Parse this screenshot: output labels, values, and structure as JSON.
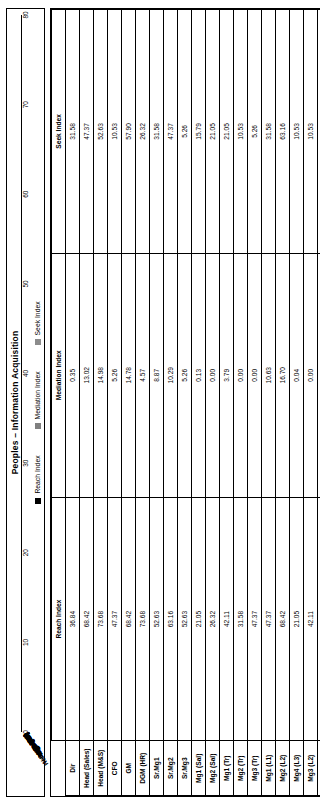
{
  "chart_data": {
    "type": "bar",
    "orientation": "horizontal",
    "title": "Peoples – Information Acquisition",
    "xlabel": "",
    "ylabel": "",
    "xlim": [
      0,
      80
    ],
    "xticks": [
      0,
      10,
      20,
      30,
      40,
      50,
      60,
      70,
      80
    ],
    "grid": true,
    "legend_position": "bottom",
    "categories": [
      "Dir",
      "Head (Sales)",
      "Head (M&S)",
      "CFO",
      "GM",
      "DGM (HR)",
      "Sr.Mg1",
      "Sr.Mg2",
      "Sr.Mg3",
      "Mg1 (Sal)",
      "Mg2 (Sal)",
      "Mg1 (Tr)",
      "Mg2 (Tr)",
      "Mg3 (Tr)",
      "Mg1 (L1)",
      "Mg2 (L2)",
      "Mg4 (L3)",
      "Mg3 (L2)",
      "Mg5 (L4)",
      "Mg6 (L5)"
    ],
    "series": [
      {
        "name": "Reach Index",
        "color": "#000000",
        "values": [
          36.84,
          68.42,
          73.68,
          47.37,
          68.42,
          73.68,
          52.63,
          63.16,
          52.63,
          21.05,
          26.32,
          42.11,
          31.58,
          47.37,
          47.37,
          68.42,
          21.05,
          42.11,
          42.11,
          15.79
        ]
      },
      {
        "name": "Mediation Index",
        "color": "#808080",
        "values": [
          0.35,
          13.02,
          14.98,
          5.26,
          14.78,
          4.57,
          8.87,
          10.29,
          5.26,
          0.13,
          0.0,
          3.79,
          0.0,
          0.0,
          10.63,
          16.7,
          0.04,
          0.0,
          3.6,
          0.0
        ]
      },
      {
        "name": "Seek Index",
        "color": "#8c8c8c",
        "values": [
          31.58,
          47.37,
          52.63,
          10.53,
          57.9,
          26.32,
          31.58,
          47.37,
          5.26,
          15.79,
          21.05,
          21.05,
          10.53,
          5.26,
          31.58,
          63.16,
          10.53,
          10.53,
          26.32,
          15.79
        ]
      }
    ]
  },
  "table": {
    "corner_label": "",
    "headers": [
      "Reach Index",
      "Mediation Index",
      "Seek Index"
    ],
    "row_header_label": "",
    "rows": [
      {
        "label": "Dir",
        "reach": "36.84",
        "mediation": "0.35",
        "seek": "31.58"
      },
      {
        "label": "Head (Sales)",
        "reach": "68.42",
        "mediation": "13.02",
        "seek": "47.37"
      },
      {
        "label": "Head (M&S)",
        "reach": "73.68",
        "mediation": "14.98",
        "seek": "52.63"
      },
      {
        "label": "CFO",
        "reach": "47.37",
        "mediation": "5.26",
        "seek": "10.53"
      },
      {
        "label": "GM",
        "reach": "68.42",
        "mediation": "14.78",
        "seek": "57.90"
      },
      {
        "label": "DGM (HR)",
        "reach": "73.68",
        "mediation": "4.57",
        "seek": "26.32"
      },
      {
        "label": "Sr.Mg1",
        "reach": "52.63",
        "mediation": "8.87",
        "seek": "31.58"
      },
      {
        "label": "Sr.Mg2",
        "reach": "63.16",
        "mediation": "10.29",
        "seek": "47.37"
      },
      {
        "label": "Sr.Mg3",
        "reach": "52.63",
        "mediation": "5.26",
        "seek": "5.26"
      },
      {
        "label": "Mg1 (Sal)",
        "reach": "21.05",
        "mediation": "0.13",
        "seek": "15.79"
      },
      {
        "label": "Mg2 (Sal)",
        "reach": "26.32",
        "mediation": "0.00",
        "seek": "21.05"
      },
      {
        "label": "Mg1 (Tr)",
        "reach": "42.11",
        "mediation": "3.79",
        "seek": "21.05"
      },
      {
        "label": "Mg2 (Tr)",
        "reach": "31.58",
        "mediation": "0.00",
        "seek": "10.53"
      },
      {
        "label": "Mg3 (Tr)",
        "reach": "47.37",
        "mediation": "0.00",
        "seek": "5.26"
      },
      {
        "label": "Mg1 (L1)",
        "reach": "47.37",
        "mediation": "10.63",
        "seek": "31.58"
      },
      {
        "label": "Mg2 (L2)",
        "reach": "68.42",
        "mediation": "16.70",
        "seek": "63.16"
      },
      {
        "label": "Mg4 (L3)",
        "reach": "21.05",
        "mediation": "0.04",
        "seek": "10.53"
      },
      {
        "label": "Mg3 (L2)",
        "reach": "42.11",
        "mediation": "0.00",
        "seek": "10.53"
      },
      {
        "label": "Mg5 (L4)",
        "reach": "42.11",
        "mediation": "3.60",
        "seek": "26.32"
      },
      {
        "label": "Mg6 (L5)",
        "reach": "15.79",
        "mediation": "0.00",
        "seek": "15.79"
      }
    ]
  }
}
